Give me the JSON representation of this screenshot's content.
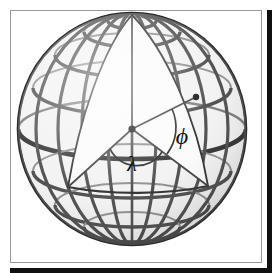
{
  "figure": {
    "type": "geometric-diagram",
    "background": "#ffffff"
  },
  "labels": {
    "longitude_angle": "λ",
    "latitude_angle": "ϕ",
    "longitude_angle_name": "lambda",
    "latitude_angle_name": "phi"
  },
  "colors": {
    "grid_dark": "#3d3d3d",
    "grid_mid": "#6e6e6e",
    "grid_light": "#a8a8a8",
    "interior_fill": "#fbfbfb",
    "outline": "#2b2b2b",
    "frame_border": "#9a9a9a",
    "shadow": "#111111",
    "page_background": "#ffffff"
  },
  "geometry": {
    "sphere_center_x": 131,
    "sphere_center_y": 128,
    "sphere_radius_x": 116,
    "sphere_radius_y": 118,
    "north_pole_x": 131,
    "north_pole_y": 14,
    "surface_point_x": 189,
    "surface_point_y": 103,
    "equator_left_x": 65,
    "equator_left_y": 185,
    "equator_right_x": 203,
    "equator_right_y": 184,
    "parallels_count": 7,
    "meridians_count": 12
  },
  "frame": {
    "margin": 10,
    "border_width": 1,
    "shadow_width": 5
  }
}
